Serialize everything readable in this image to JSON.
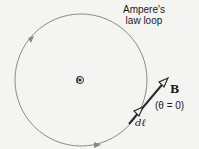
{
  "diagram": {
    "loop_label_line1": "Ampere's",
    "loop_label_line2": "law loop",
    "current_symbol": "⊙",
    "current_label": "i",
    "field_vector_label": "B",
    "angle_label": "(θ = 0)",
    "line_element_label": "dℓ",
    "colors": {
      "loop": "#8a8a8a",
      "vectors": "#2a2a2a",
      "background": "#f4f4f2"
    }
  }
}
